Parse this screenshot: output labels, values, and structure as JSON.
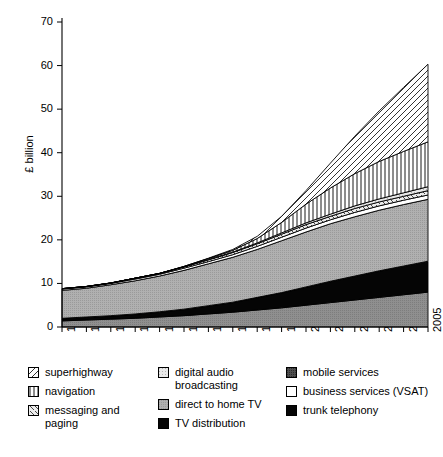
{
  "chart_data": {
    "type": "area",
    "title": "",
    "subtitle": "",
    "xlabel": "",
    "ylabel": "£ billion",
    "grid": false,
    "legend_position": "bottom",
    "stacked": true,
    "x": [
      1990,
      1991,
      1992,
      1993,
      1994,
      1995,
      1996,
      1997,
      1998,
      1999,
      2000,
      2001,
      2002,
      2003,
      2004,
      2005
    ],
    "xtick_labels": [
      "1990",
      "1991",
      "1992",
      "1993",
      "1994",
      "1995",
      "1996",
      "1997",
      "1998",
      "1999",
      "2000",
      "2001",
      "2002",
      "2003",
      "2004",
      "2005"
    ],
    "ytick_labels": [
      "0",
      "10",
      "20",
      "30",
      "40",
      "50",
      "60",
      "70"
    ],
    "yticks": [
      0,
      10,
      20,
      30,
      40,
      50,
      60,
      70
    ],
    "ylim": [
      0,
      70
    ],
    "xlim": [
      1990,
      2005
    ],
    "series": [
      {
        "name": "trunk telephony",
        "pattern": "dark-gray-solid",
        "color": "#8a8a8a",
        "values": [
          1.4,
          1.6,
          1.8,
          2.0,
          2.3,
          2.6,
          3.0,
          3.4,
          3.9,
          4.4,
          5.0,
          5.6,
          6.2,
          6.8,
          7.4,
          8.0
        ]
      },
      {
        "name": "TV distribution",
        "pattern": "black-solid",
        "color": "#000000",
        "values": [
          0.5,
          0.6,
          0.7,
          0.9,
          1.1,
          1.4,
          1.8,
          2.2,
          2.8,
          3.4,
          4.1,
          4.8,
          5.4,
          6.0,
          6.5,
          7.0
        ]
      },
      {
        "name": "mobile services",
        "pattern": "dark-stipple",
        "color": "#4a4a4a",
        "values": [
          0.1,
          0.1,
          0.1,
          0.1,
          0.1,
          0.1,
          0.1,
          0.1,
          0.1,
          0.1,
          0.1,
          0.1,
          0.1,
          0.1,
          0.1,
          0.1
        ]
      },
      {
        "name": "direct to home TV",
        "pattern": "medium-gray",
        "color": "#a9a9a9",
        "values": [
          6.4,
          6.6,
          7.1,
          7.6,
          8.2,
          8.9,
          9.6,
          10.3,
          11.0,
          11.9,
          12.6,
          13.2,
          13.6,
          13.9,
          14.1,
          14.2
        ]
      },
      {
        "name": "business services (VSAT)",
        "pattern": "white",
        "color": "#ffffff",
        "values": [
          0.3,
          0.3,
          0.3,
          0.4,
          0.4,
          0.5,
          0.5,
          0.6,
          0.7,
          0.8,
          0.9,
          0.9,
          1.0,
          1.0,
          1.0,
          1.0
        ]
      },
      {
        "name": "messaging and paging",
        "pattern": "diagonal-forward-hatch",
        "color": "#d8d8d8",
        "values": [
          0.1,
          0.1,
          0.1,
          0.2,
          0.2,
          0.3,
          0.4,
          0.5,
          0.6,
          0.7,
          0.8,
          0.8,
          0.9,
          0.9,
          0.9,
          1.0
        ]
      },
      {
        "name": "digital audio broadcasting",
        "pattern": "light-dotted",
        "color": "#e8e8e8",
        "values": [
          0.0,
          0.0,
          0.0,
          0.0,
          0.0,
          0.0,
          0.1,
          0.1,
          0.2,
          0.3,
          0.4,
          0.5,
          0.6,
          0.7,
          0.8,
          0.9
        ]
      },
      {
        "name": "navigation",
        "pattern": "vertical-lines",
        "color": "#ffffff",
        "values": [
          0.0,
          0.0,
          0.0,
          0.0,
          0.0,
          0.1,
          0.2,
          0.4,
          1.0,
          2.4,
          4.3,
          6.0,
          7.4,
          8.6,
          9.5,
          10.3
        ]
      },
      {
        "name": "superhighway",
        "pattern": "diagonal-back-hatch",
        "color": "#ffffff",
        "values": [
          0.0,
          0.0,
          0.0,
          0.0,
          0.0,
          0.0,
          0.1,
          0.2,
          0.5,
          1.4,
          3.1,
          5.7,
          8.6,
          11.6,
          14.7,
          17.8
        ]
      }
    ],
    "totals": [
      8.8,
      9.3,
      10.1,
      11.2,
      12.3,
      13.9,
      15.8,
      17.8,
      20.8,
      25.4,
      31.3,
      37.6,
      43.8,
      49.6,
      55.0,
      60.3
    ]
  },
  "axis": {
    "ylabel": "£ billion"
  },
  "legend": {
    "columns": [
      {
        "items": [
          {
            "label": "superhighway",
            "swatch": "diagonal-back-hatch"
          },
          {
            "label": "navigation",
            "swatch": "vertical-lines"
          },
          {
            "label": "messaging and paging",
            "swatch": "diagonal-forward-hatch"
          }
        ]
      },
      {
        "items": [
          {
            "label": "digital audio broadcasting",
            "swatch": "light-dotted"
          },
          {
            "label": "direct to home TV",
            "swatch": "medium-gray"
          },
          {
            "label": "TV distribution",
            "swatch": "black-solid"
          }
        ]
      },
      {
        "items": [
          {
            "label": "mobile services",
            "swatch": "dark-stipple"
          },
          {
            "label": "business services (VSAT)",
            "swatch": "white"
          },
          {
            "label": "trunk telephony",
            "swatch": "black-solid"
          }
        ]
      }
    ]
  }
}
